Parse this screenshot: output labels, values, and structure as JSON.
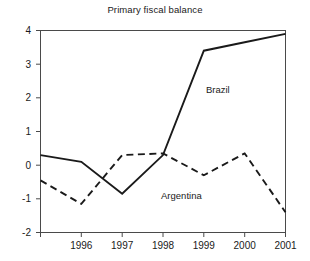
{
  "chart_data": {
    "type": "line",
    "title": "Primary fiscal balance",
    "xlabel": "",
    "ylabel": "",
    "xlim": [
      1995,
      2001
    ],
    "ylim": [
      -2,
      4
    ],
    "xticks": [
      "1996",
      "1997",
      "1998",
      "1999",
      "2000",
      "2001"
    ],
    "yticks": [
      "4",
      "3",
      "2",
      "1",
      "0",
      "-1",
      "-2"
    ],
    "grid": false,
    "legend_position": "inline-annotations",
    "x": [
      1995,
      1996,
      1997,
      1998,
      1999,
      2000,
      2001
    ],
    "series": [
      {
        "name": "Brazil",
        "style": "solid",
        "color": "#1a1a1a",
        "values": [
          0.3,
          0.1,
          -0.85,
          0.3,
          3.4,
          3.65,
          3.9
        ]
      },
      {
        "name": "Argentina",
        "style": "dashed",
        "color": "#1a1a1a",
        "values": [
          -0.45,
          -1.15,
          0.3,
          0.35,
          -0.3,
          0.35,
          -1.4
        ]
      }
    ],
    "annotations": [
      {
        "text": "Brazil",
        "x": 1999.05,
        "y": 2.15
      },
      {
        "text": "Argentina",
        "x": 1998.45,
        "y": -1.0
      }
    ]
  },
  "axes": {
    "tick_1996": "1996",
    "tick_1997": "1997",
    "tick_1998": "1998",
    "tick_1999": "1999",
    "tick_2000": "2000",
    "tick_2001": "2001",
    "tick_y4": "4",
    "tick_y3": "3",
    "tick_y2": "2",
    "tick_y1": "1",
    "tick_y0": "0",
    "tick_ym1": "-1",
    "tick_ym2": "-2"
  },
  "labels": {
    "brazil": "Brazil",
    "argentina": "Argentina"
  }
}
